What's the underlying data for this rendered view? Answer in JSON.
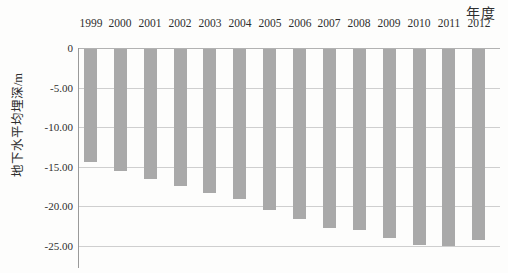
{
  "chart_data": {
    "type": "bar",
    "title": "",
    "x_axis_label": "年度",
    "y_axis_label": "地下水平均埋深/m",
    "categories": [
      "1999",
      "2000",
      "2001",
      "2002",
      "2003",
      "2004",
      "2005",
      "2006",
      "2007",
      "2008",
      "2009",
      "2010",
      "2011",
      "2012"
    ],
    "values": [
      -14.3,
      -15.4,
      -16.4,
      -17.3,
      -18.2,
      -19.0,
      -20.3,
      -21.5,
      -22.6,
      -22.8,
      -23.9,
      -24.7,
      -24.9,
      -24.1
    ],
    "y_ticks": [
      {
        "value": 0,
        "label": "0"
      },
      {
        "value": -5,
        "label": "-5.00"
      },
      {
        "value": -10,
        "label": "-10.00"
      },
      {
        "value": -15,
        "label": "-15.00"
      },
      {
        "value": -20,
        "label": "-20.00"
      },
      {
        "value": -25,
        "label": "-25.00"
      }
    ],
    "ylim": [
      -25,
      0
    ],
    "grid": "horizontal",
    "legend": "none",
    "colors": {
      "bar": "#a9a9a9",
      "gridline": "#cfcfcf",
      "zero_line": "#b2b2b2",
      "axis_line": "#9a9a9a",
      "text": "#2e2e2e",
      "background": "#fdfdfc"
    }
  }
}
